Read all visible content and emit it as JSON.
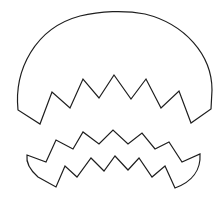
{
  "canvas": {
    "width": 222,
    "height": 212,
    "background": "#ffffff",
    "stroke_color": "#1e1e1e"
  },
  "shapes": [
    {
      "name": "top-shell-fragment",
      "description": "dome-shaped upper piece with jagged zigzag bottom edge",
      "path": "M18,110 C14,70 35,28 80,16 C100,11 125,10 145,14 C185,24 212,55 212,90 L211,109 L191,123 L179,91 L161,108 L146,79 L131,99 L114,75 L99,98 L83,79 L70,108 L52,92 L40,124 Z"
    },
    {
      "name": "bottom-shell-fragment",
      "description": "band-shaped lower piece with zigzag top and bottom edges",
      "path": "M27,155 L46,162 L56,140 L73,149 L83,132 L99,144 L113,130 L128,144 L142,133 L155,149 L169,142 L182,162 L200,154 C201,170 192,182 175,188 L165,166 L152,177 L139,158 L128,170 L115,156 L104,171 L91,158 L77,177 L65,166 L56,187 L38,177 C30,170 26,162 27,155 Z"
    }
  ]
}
